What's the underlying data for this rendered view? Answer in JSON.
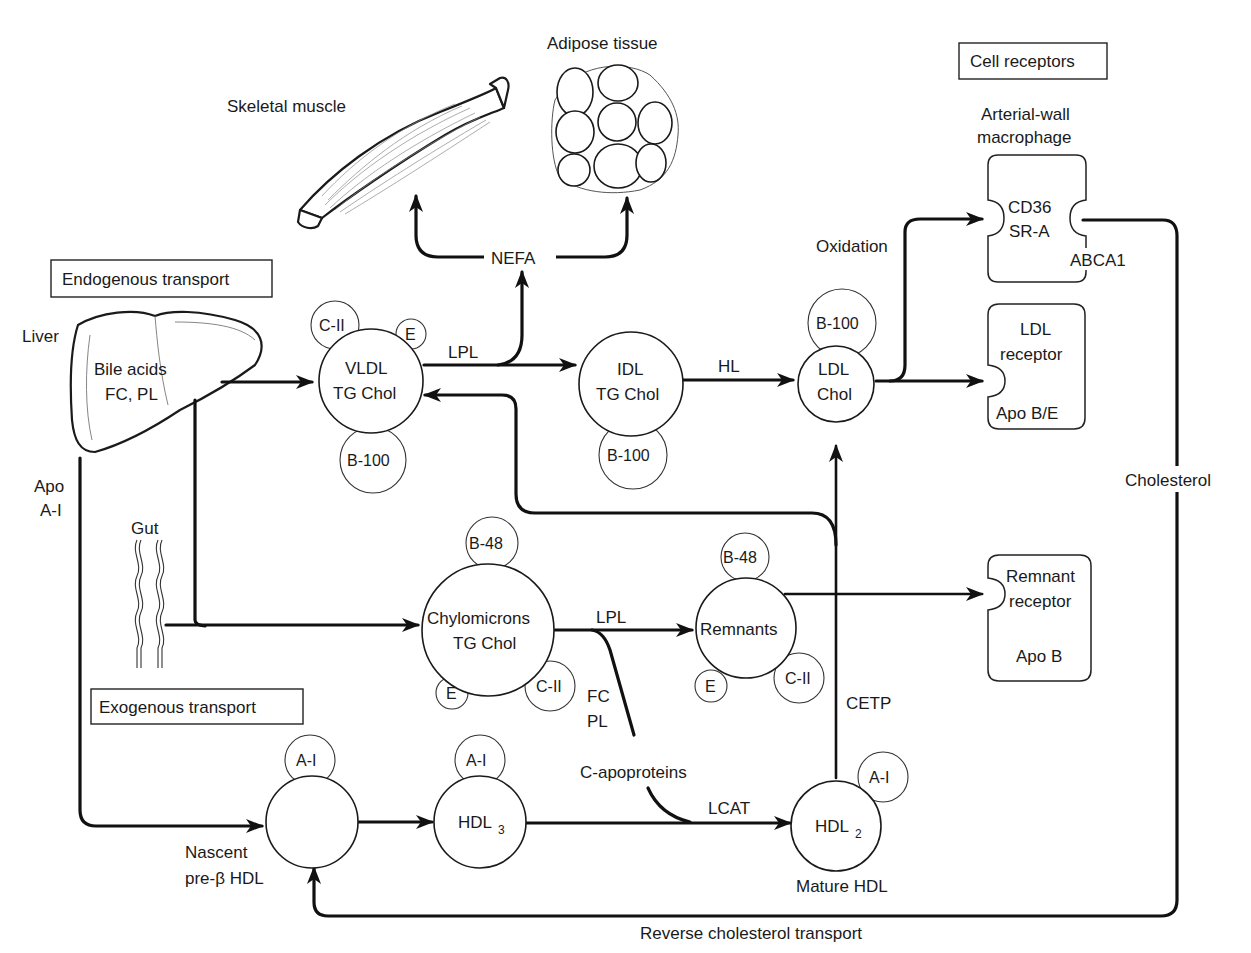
{
  "diagram": {
    "type": "lipoprotein-metabolism-pathway",
    "section_boxes": {
      "endogenous": "Endogenous transport",
      "exogenous": "Exogenous transport",
      "cell_receptors": "Cell receptors"
    },
    "tissues": {
      "skeletal_muscle": "Skeletal muscle",
      "adipose_tissue": "Adipose tissue",
      "liver": "Liver",
      "liver_contents_line1": "Bile acids",
      "liver_contents_line2": "FC, PL",
      "gut": "Gut"
    },
    "nodes": {
      "vldl": {
        "line1": "VLDL",
        "line2": "TG Chol",
        "apos": [
          "C-II",
          "E",
          "B-100"
        ]
      },
      "idl": {
        "line1": "IDL",
        "line2": "TG Chol",
        "apos": [
          "B-100"
        ]
      },
      "ldl": {
        "line1": "LDL",
        "line2": "Chol",
        "apos": [
          "B-100"
        ]
      },
      "chylomicrons": {
        "line1": "Chylomicrons",
        "line2": "TG Chol",
        "apos": [
          "B-48",
          "E",
          "C-II"
        ]
      },
      "remnants": {
        "line1": "Remnants",
        "apos": [
          "B-48",
          "E",
          "C-II"
        ]
      },
      "nascent_hdl": {
        "caption_line1": "Nascent",
        "caption_line2": "pre-β HDL",
        "apos": [
          "A-I"
        ]
      },
      "hdl3": {
        "label": "HDL",
        "subscript": "3",
        "apos": [
          "A-I"
        ]
      },
      "hdl2": {
        "label": "HDL",
        "subscript": "2",
        "caption": "Mature HDL",
        "apos": [
          "A-I"
        ]
      }
    },
    "receptors": {
      "macrophage": {
        "title_line1": "Arterial-wall",
        "title_line2": "macrophage",
        "site_line1": "CD36",
        "site_line2": "SR-A",
        "efflux": "ABCA1"
      },
      "ldl_receptor": {
        "line1": "LDL",
        "line2": "receptor",
        "ligand": "Apo B/E"
      },
      "remnant_receptor": {
        "line1": "Remnant",
        "line2": "receptor",
        "ligand": "Apo B"
      }
    },
    "edge_labels": {
      "nefa": "NEFA",
      "lpl_vldl": "LPL",
      "hl": "HL",
      "oxidation": "Oxidation",
      "lpl_chylo": "LPL",
      "fc": "FC",
      "pl": "PL",
      "c_apoproteins": "C-apoproteins",
      "lcat": "LCAT",
      "cetp": "CETP",
      "apo_line1": "Apo",
      "apo_line2": "A-I",
      "cholesterol": "Cholesterol",
      "reverse_transport": "Reverse cholesterol transport"
    }
  }
}
